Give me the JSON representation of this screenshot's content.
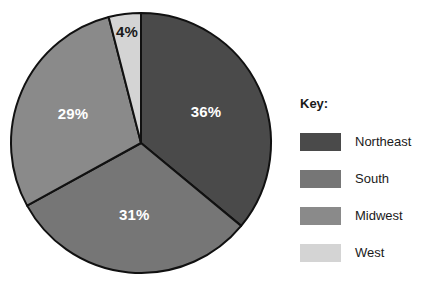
{
  "chart_data": {
    "type": "pie",
    "title": "",
    "legend_title": "Key:",
    "legend_position": "right",
    "categories": [
      "Northeast",
      "South",
      "Midwest",
      "West"
    ],
    "values": [
      36,
      31,
      29,
      4
    ],
    "value_labels": [
      "36%",
      "31%",
      "29%",
      "4%"
    ],
    "unit": "%",
    "colors": [
      "#4a4a4a",
      "#767676",
      "#8a8a8a",
      "#d4d4d4"
    ],
    "label_colors": [
      "#ffffff",
      "#ffffff",
      "#ffffff",
      "#1a1a1a"
    ],
    "slice_border_color": "#111111",
    "background": "#ffffff",
    "start_angle_deg": 0,
    "direction": "clockwise",
    "slices": [
      {
        "name": "Northeast",
        "value": 36,
        "label": "36%",
        "color": "#4a4a4a",
        "label_color": "#ffffff",
        "start_deg": 0,
        "end_deg": 129.6
      },
      {
        "name": "South",
        "value": 31,
        "label": "31%",
        "color": "#767676",
        "label_color": "#ffffff",
        "start_deg": 129.6,
        "end_deg": 241.2
      },
      {
        "name": "Midwest",
        "value": 29,
        "label": "29%",
        "color": "#8a8a8a",
        "label_color": "#ffffff",
        "start_deg": 241.2,
        "end_deg": 345.6
      },
      {
        "name": "West",
        "value": 4,
        "label": "4%",
        "color": "#d4d4d4",
        "label_color": "#1a1a1a",
        "start_deg": 345.6,
        "end_deg": 360
      }
    ]
  },
  "legend": {
    "title": "Key:",
    "items": [
      {
        "label": "Northeast",
        "color": "#4a4a4a"
      },
      {
        "label": "South",
        "color": "#767676"
      },
      {
        "label": "Midwest",
        "color": "#8a8a8a"
      },
      {
        "label": "West",
        "color": "#d4d4d4"
      }
    ]
  }
}
